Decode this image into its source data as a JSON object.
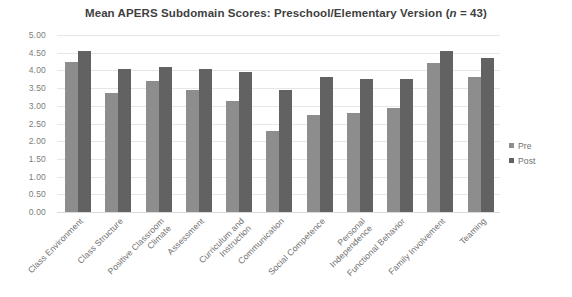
{
  "chart_data": {
    "type": "bar",
    "title": "Mean APERS Subdomain Scores: Preschool/Elementary Version (n = 43)",
    "title_prefix": "Mean APERS Subdomain Scores: Preschool/Elementary Version (",
    "title_italic": "n",
    "title_suffix": " = 43)",
    "xlabel": "",
    "ylabel": "",
    "ylim": [
      0,
      5
    ],
    "ytick_labels": [
      "5.00",
      "4.50",
      "4.00",
      "3.50",
      "3.00",
      "2.50",
      "2.00",
      "1.50",
      "1.00",
      "0.50",
      "0.00"
    ],
    "ytick_values": [
      5.0,
      4.5,
      4.0,
      3.5,
      3.0,
      2.5,
      2.0,
      1.5,
      1.0,
      0.5,
      0.0
    ],
    "grid": true,
    "legend_position": "right",
    "categories": [
      "Class Environment",
      "Class Structure",
      "Positive Classroom Climate",
      "Assessment",
      "Curriculum and Instruction",
      "Communication",
      "Social Competence",
      "Personal Independence",
      "Functional Behavior",
      "Family Involvement",
      "Teaming"
    ],
    "category_lines": [
      [
        "Class Environment"
      ],
      [
        "Class Structure"
      ],
      [
        "Positive Classroom",
        "Climate"
      ],
      [
        "Assessment"
      ],
      [
        "Curriculum and",
        "Instruction"
      ],
      [
        "Communication"
      ],
      [
        "Social Competence"
      ],
      [
        "Personal",
        "Independence"
      ],
      [
        "Functional Behavior"
      ],
      [
        "Family Involvement"
      ],
      [
        "Teaming"
      ]
    ],
    "series": [
      {
        "name": "Pre",
        "color": "#8d8d8d",
        "values": [
          4.25,
          3.35,
          3.7,
          3.45,
          3.15,
          2.3,
          2.75,
          2.8,
          2.95,
          4.2,
          3.8
        ]
      },
      {
        "name": "Post",
        "color": "#626262",
        "values": [
          4.55,
          4.05,
          4.1,
          4.05,
          3.95,
          3.45,
          3.8,
          3.75,
          3.75,
          4.55,
          4.35
        ]
      }
    ]
  },
  "legend": {
    "items": [
      {
        "label": "Pre",
        "color": "#8d8d8d"
      },
      {
        "label": "Post",
        "color": "#626262"
      }
    ]
  }
}
